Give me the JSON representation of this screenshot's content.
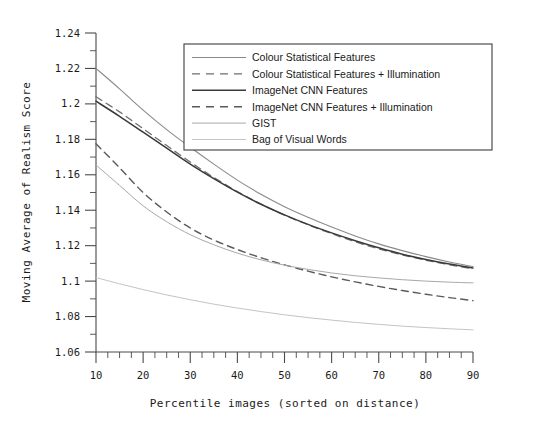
{
  "chart_data": {
    "type": "line",
    "title": "",
    "xlabel": "Percentile images (sorted on distance)",
    "ylabel": "Moving Average of Realism Score",
    "xlim": [
      10,
      90
    ],
    "ylim": [
      1.06,
      1.24
    ],
    "grid": false,
    "legend_position": "top-center-right",
    "x_ticks": [
      10,
      20,
      30,
      40,
      50,
      60,
      70,
      80,
      90
    ],
    "x_tick_labels": [
      "10",
      "20",
      "30",
      "40",
      "50",
      "60",
      "70",
      "80",
      "90"
    ],
    "x_minor_interval": 2.5,
    "y_ticks": [
      1.06,
      1.08,
      1.1,
      1.12,
      1.14,
      1.16,
      1.18,
      1.2,
      1.22,
      1.24
    ],
    "y_tick_labels": [
      "1.06",
      "1.08",
      "1.1",
      "1.12",
      "1.14",
      "1.16",
      "1.18",
      "1.2",
      "1.22",
      "1.24"
    ],
    "y_minor_interval": 0.01,
    "x": [
      10,
      15,
      20,
      25,
      30,
      35,
      40,
      45,
      50,
      55,
      60,
      65,
      70,
      75,
      80,
      85,
      90
    ],
    "series": [
      {
        "name": "Colour Statistical Features",
        "style": "solid",
        "color": "#8a8a8a",
        "width": 1.1,
        "values": [
          1.22,
          1.2085,
          1.1965,
          1.1855,
          1.1755,
          1.166,
          1.157,
          1.149,
          1.142,
          1.136,
          1.1305,
          1.1255,
          1.121,
          1.1172,
          1.1138,
          1.1108,
          1.1082
        ]
      },
      {
        "name": "Colour Statistical Features + Illumination",
        "style": "dashed",
        "color": "#6e6e6e",
        "width": 1.3,
        "values": [
          1.204,
          1.1955,
          1.186,
          1.1765,
          1.1672,
          1.1585,
          1.1505,
          1.1435,
          1.1372,
          1.1318,
          1.1268,
          1.1222,
          1.1182,
          1.1148,
          1.1118,
          1.1092,
          1.107
        ]
      },
      {
        "name": "ImageNet CNN Features",
        "style": "solid",
        "color": "#3a3a3a",
        "width": 1.5,
        "values": [
          1.2015,
          1.193,
          1.184,
          1.175,
          1.166,
          1.1578,
          1.1502,
          1.1434,
          1.1374,
          1.132,
          1.1272,
          1.1228,
          1.1188,
          1.1152,
          1.1122,
          1.1096,
          1.1074
        ]
      },
      {
        "name": "ImageNet CNN Features + Illumination",
        "style": "dashed",
        "color": "#5a5a5a",
        "width": 1.4,
        "values": [
          1.1775,
          1.164,
          1.15,
          1.139,
          1.13,
          1.1232,
          1.1178,
          1.1132,
          1.1092,
          1.1056,
          1.1024,
          1.0996,
          1.097,
          1.0947,
          1.0926,
          1.0907,
          1.089
        ]
      },
      {
        "name": "GIST",
        "style": "solid",
        "color": "#a8a8a8",
        "width": 1.0,
        "values": [
          1.1655,
          1.154,
          1.1425,
          1.1335,
          1.1262,
          1.1205,
          1.1158,
          1.112,
          1.109,
          1.1066,
          1.1046,
          1.103,
          1.1018,
          1.1008,
          1.1,
          1.0994,
          1.099
        ]
      },
      {
        "name": "Bag of Visual Words",
        "style": "solid",
        "color": "#c4c4c4",
        "width": 1.0,
        "values": [
          1.102,
          1.0985,
          1.0952,
          1.0922,
          1.0895,
          1.087,
          1.0848,
          1.0828,
          1.081,
          1.0794,
          1.078,
          1.0767,
          1.0756,
          1.0746,
          1.0738,
          1.0731,
          1.0725
        ]
      }
    ]
  },
  "legend": {
    "items": [
      {
        "label": "Colour Statistical Features"
      },
      {
        "label": "Colour Statistical Features + Illumination"
      },
      {
        "label": "ImageNet CNN Features"
      },
      {
        "label": "ImageNet CNN Features + Illumination"
      },
      {
        "label": "GIST"
      },
      {
        "label": "Bag of Visual Words"
      }
    ]
  }
}
